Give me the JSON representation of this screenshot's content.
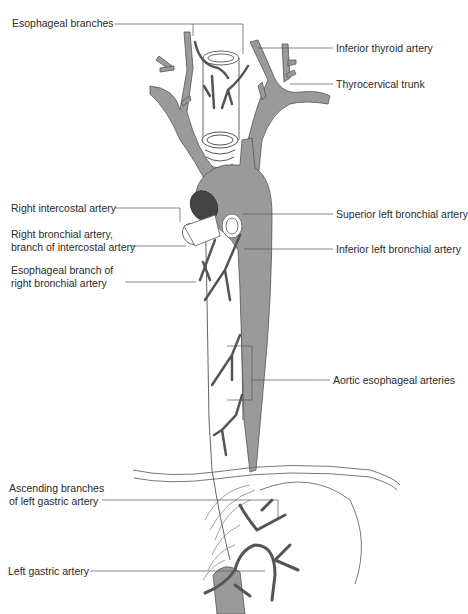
{
  "figure": {
    "colors": {
      "artery_fill": "#9a9a9a",
      "artery_stroke": "#555555",
      "esophagus_stroke": "#666666",
      "leader_line": "#555555",
      "background": "#ffffff"
    }
  },
  "labels": {
    "esophageal_branches": "Esophageal branches",
    "inferior_thyroid_artery": "Inferior thyroid artery",
    "thyrocervical_trunk": "Thyrocervical trunk",
    "right_intercostal_artery": "Right intercostal artery",
    "right_bronchial_artery": {
      "line1": "Right bronchial artery,",
      "line2": "branch of intercostal artery"
    },
    "esophageal_branch_right_bronchial": {
      "line1": "Esophageal branch of",
      "line2": "right bronchial artery"
    },
    "superior_left_bronchial_artery": "Superior left bronchial artery",
    "inferior_left_bronchial_artery": "Inferior left bronchial artery",
    "aortic_esophageal_arteries": "Aortic esophageal arteries",
    "ascending_branches_left_gastric": {
      "line1": "Ascending branches",
      "line2": "of left gastric artery"
    },
    "left_gastric_artery": "Left gastric artery"
  }
}
